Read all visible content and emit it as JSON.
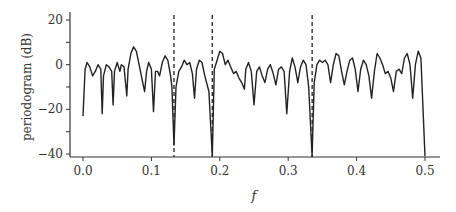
{
  "chart_data": {
    "type": "line",
    "title": "",
    "xlabel": "f",
    "ylabel": "periodogram (dB)",
    "xlim": [
      -0.02,
      0.52
    ],
    "ylim": [
      -42,
      22
    ],
    "xticks": [
      0.0,
      0.1,
      0.2,
      0.3,
      0.4,
      0.5
    ],
    "xtick_labels": [
      "0.0",
      "0.1",
      "0.2",
      "0.3",
      "0.4",
      "0.5"
    ],
    "yticks": [
      20,
      10,
      0,
      -10,
      -20,
      -30,
      -40
    ],
    "ytick_labels": [
      "20",
      "",
      "0",
      "",
      "−20",
      "",
      "−40"
    ],
    "grid": false,
    "legend": null,
    "vlines": [
      {
        "x": 0.133,
        "style": "dashed"
      },
      {
        "x": 0.189,
        "style": "dashed"
      },
      {
        "x": 0.335,
        "style": "dashed"
      }
    ],
    "series": [
      {
        "name": "periodogram",
        "color": "#222222",
        "points": [
          [
            0.0,
            -23
          ],
          [
            0.003,
            -2
          ],
          [
            0.006,
            1
          ],
          [
            0.01,
            -1
          ],
          [
            0.014,
            -5
          ],
          [
            0.018,
            -3
          ],
          [
            0.022,
            0
          ],
          [
            0.026,
            -2
          ],
          [
            0.028,
            -22
          ],
          [
            0.03,
            -5
          ],
          [
            0.034,
            0
          ],
          [
            0.038,
            -1
          ],
          [
            0.042,
            -3
          ],
          [
            0.044,
            -18
          ],
          [
            0.046,
            -3
          ],
          [
            0.05,
            1
          ],
          [
            0.054,
            -3
          ],
          [
            0.056,
            0
          ],
          [
            0.06,
            -1
          ],
          [
            0.064,
            -14
          ],
          [
            0.066,
            -2
          ],
          [
            0.07,
            5
          ],
          [
            0.074,
            8
          ],
          [
            0.078,
            6
          ],
          [
            0.082,
            0
          ],
          [
            0.086,
            -6
          ],
          [
            0.09,
            -12
          ],
          [
            0.093,
            -3
          ],
          [
            0.096,
            1
          ],
          [
            0.1,
            -2
          ],
          [
            0.103,
            -21
          ],
          [
            0.106,
            -3
          ],
          [
            0.109,
            -3
          ],
          [
            0.112,
            -5
          ],
          [
            0.116,
            1
          ],
          [
            0.12,
            4
          ],
          [
            0.124,
            2
          ],
          [
            0.128,
            -5
          ],
          [
            0.13,
            -10
          ],
          [
            0.133,
            -36
          ],
          [
            0.136,
            -10
          ],
          [
            0.14,
            -3
          ],
          [
            0.144,
            -1
          ],
          [
            0.148,
            2
          ],
          [
            0.152,
            0
          ],
          [
            0.156,
            1
          ],
          [
            0.16,
            -4
          ],
          [
            0.163,
            -15
          ],
          [
            0.166,
            -2
          ],
          [
            0.17,
            2
          ],
          [
            0.174,
            1
          ],
          [
            0.178,
            -5
          ],
          [
            0.184,
            -12
          ],
          [
            0.189,
            -42
          ],
          [
            0.192,
            -2
          ],
          [
            0.196,
            2
          ],
          [
            0.2,
            6
          ],
          [
            0.204,
            5
          ],
          [
            0.208,
            0
          ],
          [
            0.212,
            2
          ],
          [
            0.216,
            -1
          ],
          [
            0.22,
            -4
          ],
          [
            0.224,
            -3
          ],
          [
            0.228,
            -6
          ],
          [
            0.232,
            -8
          ],
          [
            0.236,
            -11
          ],
          [
            0.238,
            -2
          ],
          [
            0.242,
            1
          ],
          [
            0.246,
            -3
          ],
          [
            0.25,
            -18
          ],
          [
            0.254,
            -3
          ],
          [
            0.258,
            -1
          ],
          [
            0.262,
            -5
          ],
          [
            0.266,
            -8
          ],
          [
            0.27,
            -2
          ],
          [
            0.274,
            0
          ],
          [
            0.278,
            -4
          ],
          [
            0.282,
            -9
          ],
          [
            0.286,
            -2
          ],
          [
            0.29,
            -1
          ],
          [
            0.294,
            -3
          ],
          [
            0.298,
            -22
          ],
          [
            0.302,
            -3
          ],
          [
            0.306,
            3
          ],
          [
            0.31,
            -1
          ],
          [
            0.314,
            -8
          ],
          [
            0.318,
            -1
          ],
          [
            0.322,
            2
          ],
          [
            0.326,
            0
          ],
          [
            0.33,
            -10
          ],
          [
            0.335,
            -42
          ],
          [
            0.338,
            -8
          ],
          [
            0.342,
            0
          ],
          [
            0.346,
            2
          ],
          [
            0.35,
            1
          ],
          [
            0.354,
            2
          ],
          [
            0.358,
            0
          ],
          [
            0.362,
            -8
          ],
          [
            0.366,
            0
          ],
          [
            0.37,
            5
          ],
          [
            0.374,
            4
          ],
          [
            0.378,
            -3
          ],
          [
            0.382,
            -9
          ],
          [
            0.386,
            -3
          ],
          [
            0.39,
            2
          ],
          [
            0.394,
            3
          ],
          [
            0.398,
            -2
          ],
          [
            0.402,
            -12
          ],
          [
            0.406,
            -2
          ],
          [
            0.41,
            2
          ],
          [
            0.414,
            0
          ],
          [
            0.418,
            -5
          ],
          [
            0.422,
            -15
          ],
          [
            0.426,
            -3
          ],
          [
            0.43,
            5
          ],
          [
            0.434,
            3
          ],
          [
            0.438,
            0
          ],
          [
            0.442,
            -4
          ],
          [
            0.446,
            -3
          ],
          [
            0.45,
            -6
          ],
          [
            0.454,
            -12
          ],
          [
            0.458,
            -3
          ],
          [
            0.462,
            -2
          ],
          [
            0.466,
            -4
          ],
          [
            0.47,
            3
          ],
          [
            0.474,
            5
          ],
          [
            0.478,
            0
          ],
          [
            0.482,
            -15
          ],
          [
            0.486,
            0
          ],
          [
            0.49,
            6
          ],
          [
            0.494,
            3
          ],
          [
            0.5,
            -42
          ]
        ]
      }
    ]
  }
}
